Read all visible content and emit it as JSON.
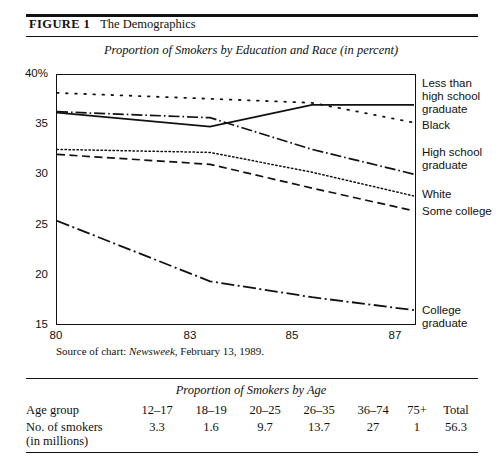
{
  "figure": {
    "label": "FIGURE 1",
    "title": "The Demographics"
  },
  "source_note": {
    "prefix": "Source of chart: ",
    "publication": "Newsweek",
    "suffix": ", February 13, 1989."
  },
  "chart_data": {
    "type": "line",
    "title": "Proportion of Smokers by Education and Race (in percent)",
    "xlabel": "",
    "ylabel": "",
    "x": [
      80,
      83,
      85,
      87
    ],
    "xticklabels": [
      "80",
      "83",
      "85",
      "87"
    ],
    "yticklabels": [
      "40%",
      "35",
      "30",
      "25",
      "20",
      "15"
    ],
    "ytickvalues": [
      40,
      35,
      30,
      25,
      20,
      15
    ],
    "xlim": [
      80,
      87
    ],
    "ylim": [
      15,
      40
    ],
    "grid": false,
    "legend_position": "right-inline",
    "series": [
      {
        "name": "Less than high school graduate",
        "label": "Less than\nhigh school\ngraduate",
        "style": "solid",
        "values": [
          36.2,
          34.8,
          37.0,
          37.0
        ]
      },
      {
        "name": "Black",
        "label": "Black",
        "style": "dotted-coarse",
        "values": [
          38.2,
          37.6,
          37.2,
          35.2
        ]
      },
      {
        "name": "High school graduate",
        "label": "High school\ngraduate",
        "style": "dash-dot-fine",
        "values": [
          36.3,
          35.7,
          32.5,
          30.0
        ]
      },
      {
        "name": "White",
        "label": "White",
        "style": "dotted-fine",
        "values": [
          32.5,
          32.2,
          30.2,
          27.8
        ]
      },
      {
        "name": "Some college",
        "label": "Some college",
        "style": "dashed",
        "values": [
          32.0,
          31.0,
          28.6,
          26.3
        ]
      },
      {
        "name": "College graduate",
        "label": "College\ngraduate",
        "style": "dash-dot-long",
        "values": [
          25.3,
          19.2,
          17.6,
          16.3
        ]
      }
    ]
  },
  "age_table": {
    "title": "Proportion of Smokers by Age",
    "rows": [
      {
        "header": "Age group",
        "cells": [
          "12–17",
          "18–19",
          "20–25",
          "26–35",
          "36–74",
          "75+",
          "Total"
        ]
      },
      {
        "header": "No. of smokers\n  (in millions)",
        "cells": [
          "3.3",
          "1.6",
          "9.7",
          "13.7",
          "27",
          "1",
          "56.3"
        ]
      }
    ]
  }
}
